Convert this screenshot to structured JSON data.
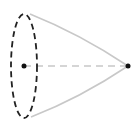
{
  "diagram": {
    "type": "cone",
    "colors": {
      "base_outline": "#222222",
      "sides": "#c8c8c8",
      "axis": "#c8c8c8",
      "points": "#111111",
      "background": "#ffffff"
    },
    "base": {
      "cx": 24,
      "cy": 66,
      "rx": 14,
      "ry": 52,
      "style": "dashed"
    },
    "center_point": {
      "x": 24,
      "y": 66
    },
    "apex_point": {
      "x": 128,
      "y": 66
    },
    "axis_line": {
      "style": "dashed",
      "from": "center_point",
      "to": "apex_point"
    }
  }
}
